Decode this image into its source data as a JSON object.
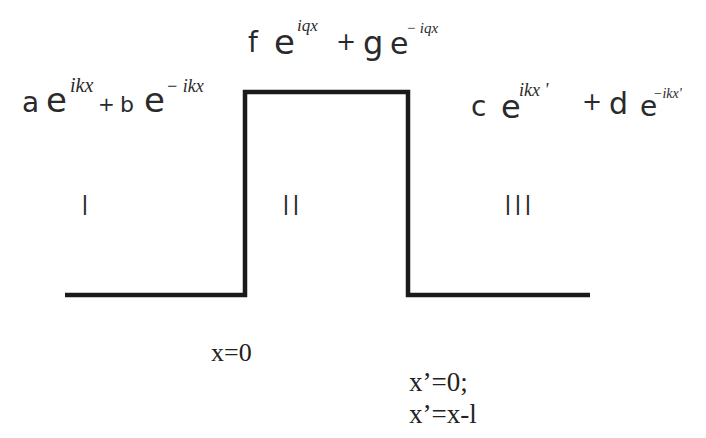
{
  "diagram": {
    "type": "potential_barrier",
    "regions": [
      {
        "id": "I",
        "label": "I",
        "wavefunction": {
          "coef1": "a",
          "exp1": "ikx",
          "op": "+",
          "coef2": "b",
          "exp2": "− ikx"
        }
      },
      {
        "id": "II",
        "label": "II",
        "wavefunction": {
          "coef1": "f",
          "exp1": "iqx",
          "op": "+",
          "coef2": "g",
          "exp2": "− iqx"
        }
      },
      {
        "id": "III",
        "label": "III",
        "wavefunction": {
          "coef1": "c",
          "exp1": "ikx '",
          "op": "+",
          "coef2": "d",
          "exp2": "−ikx'"
        }
      }
    ],
    "base": "e",
    "boundaries": {
      "left": "x=0",
      "right_line1": "x’=0;",
      "right_line2": "x’=x-l"
    },
    "potential_path": [
      [
        65,
        295
      ],
      [
        245,
        295
      ],
      [
        245,
        92
      ],
      [
        408,
        92
      ],
      [
        408,
        295
      ],
      [
        590,
        295
      ]
    ],
    "line_color": "#1a1a1a"
  }
}
